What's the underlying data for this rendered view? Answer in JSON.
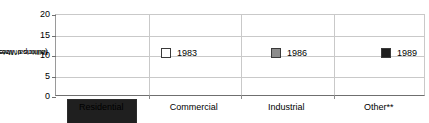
{
  "chart_data": {
    "type": "bar",
    "subtype": "stacked-vertical",
    "title": "",
    "xlabel": "",
    "ylabel": "Municipal Water Use (billions of litres/day)",
    "ylabel_line1": "Municipal Water Use",
    "ylabel_line2": "(billions of litres/day)",
    "categories": [
      "Residential",
      "Commercial",
      "Industrial",
      "Other**"
    ],
    "ylim": [
      0,
      20
    ],
    "yticks": [
      0,
      5,
      10,
      15,
      20
    ],
    "ytick_labels": [
      "0",
      "5",
      "10",
      "15",
      "20"
    ],
    "grid": true,
    "legend_position": "inside-upper-right",
    "series": [
      {
        "name": "1983",
        "color": "#ffffff",
        "values": [
          6.0,
          2.3,
          1.0,
          0.5
        ]
      },
      {
        "name": "1986",
        "color": "#8c8c8c",
        "values": [
          6.0,
          2.7,
          4.2,
          3.3
        ]
      },
      {
        "name": "1989",
        "color": "#1f1f1f",
        "values": [
          7.0,
          2.5,
          2.6,
          3.0
        ]
      }
    ],
    "totals": [
      19.0,
      7.5,
      7.8,
      6.8
    ],
    "annotations": [
      "**"
    ]
  },
  "legend": {
    "items": [
      {
        "label": "1983",
        "color": "#ffffff"
      },
      {
        "label": "1986",
        "color": "#8c8c8c"
      },
      {
        "label": "1989",
        "color": "#1f1f1f"
      }
    ]
  },
  "colors": {
    "series_1983": "#ffffff",
    "series_1986": "#8c8c8c",
    "series_1989": "#1f1f1f",
    "gridline": "#c9c9c9",
    "axis": "#6f6f6f",
    "bar_outline": "#2b2b2b",
    "background": "#ffffff",
    "text": "#000000"
  }
}
